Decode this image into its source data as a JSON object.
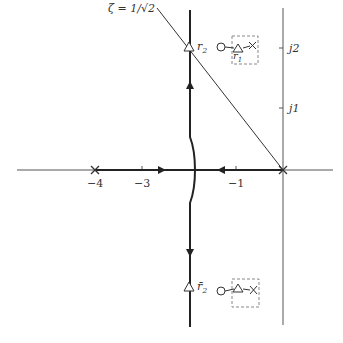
{
  "diagram": {
    "type": "root-locus",
    "damping_label": "ζ = 1/√2",
    "axes": {
      "real_ticks": [
        {
          "value": -4,
          "label": "−4"
        },
        {
          "value": -3,
          "label": "−3"
        },
        {
          "value": -1,
          "label": "−1"
        }
      ],
      "imag_ticks": [
        {
          "value": 1,
          "label": "j1"
        },
        {
          "value": 2,
          "label": "j2"
        }
      ]
    },
    "poles": [
      {
        "re": -4,
        "im": 0
      },
      {
        "re": 0,
        "im": 0
      }
    ],
    "closed_loop_points": {
      "upper": {
        "label": "r",
        "sub": "2",
        "re": -2,
        "im": 2
      },
      "lower": {
        "label": "r̄",
        "sub": "2",
        "re": -2,
        "im": -2
      }
    },
    "insets": {
      "upper": {
        "label": "r",
        "sub": "1"
      },
      "lower": {
        "label": ""
      }
    },
    "colors": {
      "line": "#222222",
      "axis": "#555555",
      "dashed": "#888888",
      "background": "#ffffff"
    }
  }
}
